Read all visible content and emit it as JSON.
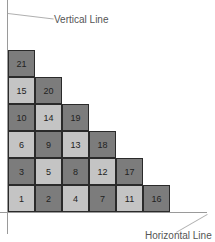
{
  "labels": {
    "vertical": "Vertical Line",
    "horizontal": "Horizontal Line"
  },
  "colors": {
    "light": "#c4c4c4",
    "dark": "#7c7c7c",
    "border": "#2a2a2a",
    "axis": "#9a9a9a"
  },
  "cells": [
    {
      "n": "1",
      "row": 0,
      "col": 0,
      "tone": "light"
    },
    {
      "n": "2",
      "row": 0,
      "col": 1,
      "tone": "dark"
    },
    {
      "n": "4",
      "row": 0,
      "col": 2,
      "tone": "light"
    },
    {
      "n": "7",
      "row": 0,
      "col": 3,
      "tone": "dark"
    },
    {
      "n": "11",
      "row": 0,
      "col": 4,
      "tone": "light"
    },
    {
      "n": "16",
      "row": 0,
      "col": 5,
      "tone": "dark"
    },
    {
      "n": "3",
      "row": 1,
      "col": 0,
      "tone": "dark"
    },
    {
      "n": "5",
      "row": 1,
      "col": 1,
      "tone": "light"
    },
    {
      "n": "8",
      "row": 1,
      "col": 2,
      "tone": "dark"
    },
    {
      "n": "12",
      "row": 1,
      "col": 3,
      "tone": "light"
    },
    {
      "n": "17",
      "row": 1,
      "col": 4,
      "tone": "dark"
    },
    {
      "n": "6",
      "row": 2,
      "col": 0,
      "tone": "light"
    },
    {
      "n": "9",
      "row": 2,
      "col": 1,
      "tone": "dark"
    },
    {
      "n": "13",
      "row": 2,
      "col": 2,
      "tone": "light"
    },
    {
      "n": "18",
      "row": 2,
      "col": 3,
      "tone": "dark"
    },
    {
      "n": "10",
      "row": 3,
      "col": 0,
      "tone": "dark"
    },
    {
      "n": "14",
      "row": 3,
      "col": 1,
      "tone": "light"
    },
    {
      "n": "19",
      "row": 3,
      "col": 2,
      "tone": "dark"
    },
    {
      "n": "15",
      "row": 4,
      "col": 0,
      "tone": "light"
    },
    {
      "n": "20",
      "row": 4,
      "col": 1,
      "tone": "dark"
    },
    {
      "n": "21",
      "row": 5,
      "col": 0,
      "tone": "dark"
    }
  ]
}
